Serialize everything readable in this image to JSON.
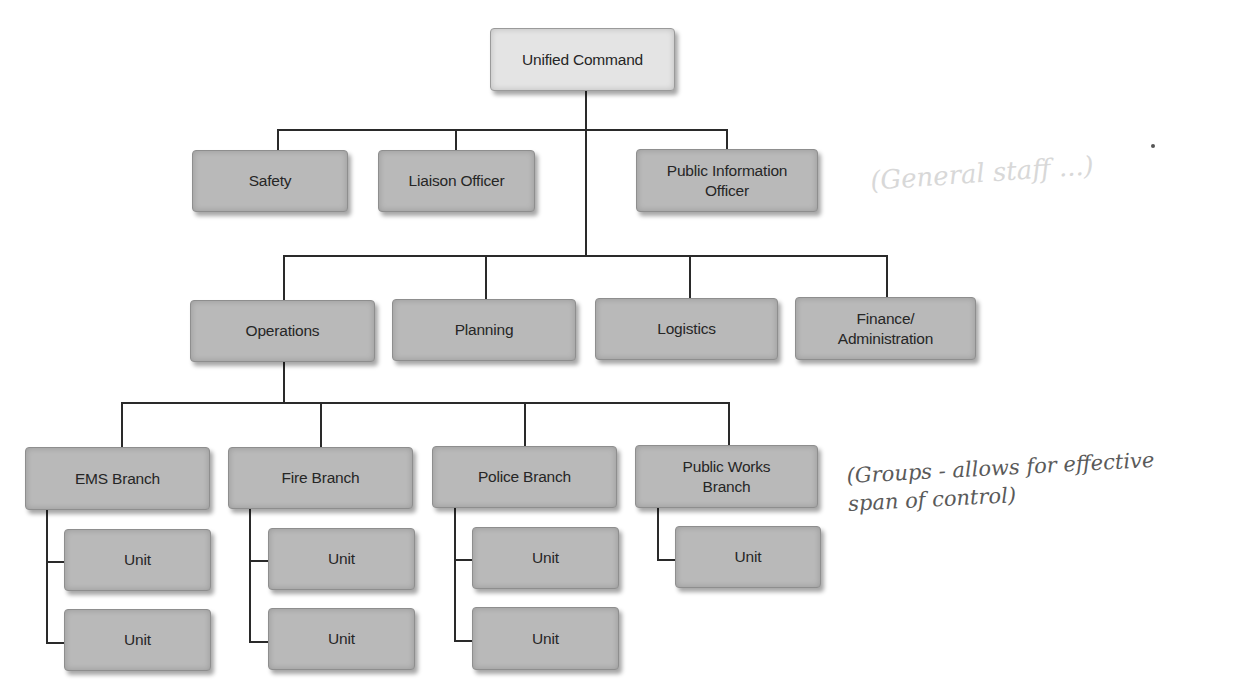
{
  "diagram": {
    "type": "org-chart",
    "root": {
      "label": "Unified Command",
      "command_staff": [
        {
          "label": "Safety"
        },
        {
          "label": "Liaison Officer"
        },
        {
          "label": "Public Information\nOfficer"
        }
      ],
      "general_staff": [
        {
          "label": "Operations",
          "branches": [
            {
              "label": "EMS Branch",
              "units": [
                {
                  "label": "Unit"
                },
                {
                  "label": "Unit"
                }
              ]
            },
            {
              "label": "Fire Branch",
              "units": [
                {
                  "label": "Unit"
                },
                {
                  "label": "Unit"
                }
              ]
            },
            {
              "label": "Police Branch",
              "units": [
                {
                  "label": "Unit"
                },
                {
                  "label": "Unit"
                }
              ]
            },
            {
              "label": "Public Works\nBranch",
              "units": [
                {
                  "label": "Unit"
                }
              ]
            }
          ]
        },
        {
          "label": "Planning"
        },
        {
          "label": "Logistics"
        },
        {
          "label": "Finance/\nAdministration"
        }
      ]
    }
  },
  "annotations": {
    "handwritten_note": "(Groups - allows for effective\n span of control)",
    "faint_bleedthrough": "(General staff ...)"
  },
  "colors": {
    "box_fill": "#b9b9b9",
    "root_fill": "#e4e4e4",
    "connector": "#2a2a2a",
    "text": "#262626"
  }
}
